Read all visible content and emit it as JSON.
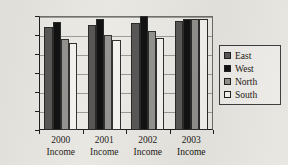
{
  "chart_data": {
    "type": "bar",
    "title": "",
    "subtitle": "",
    "xlabel": "",
    "ylabel": "",
    "categories": [
      "2000 Income",
      "2001 Income",
      "2002 Income",
      "2003 Income"
    ],
    "category_lines": [
      [
        "2000",
        "Income"
      ],
      [
        "2001",
        "Income"
      ],
      [
        "2002",
        "Income"
      ],
      [
        "2003",
        "Income"
      ]
    ],
    "series": [
      {
        "name": "East",
        "color": "#595755",
        "values": [
          27200,
          27700,
          28200,
          28600
        ]
      },
      {
        "name": "West",
        "color": "#121212",
        "values": [
          28500,
          29100,
          30000,
          29100
        ]
      },
      {
        "name": "North",
        "color": "#918f8c",
        "values": [
          24000,
          25000,
          26000,
          29200
        ]
      },
      {
        "name": "South",
        "color": "#f4f2ee",
        "values": [
          22900,
          23800,
          24300,
          29200
        ]
      }
    ],
    "ylim": [
      0,
      30000
    ],
    "ytick_values": [
      0,
      5000,
      10000,
      15000,
      20000,
      25000,
      30000
    ],
    "ytick_labels": [
      "0",
      "5,000",
      "10,000",
      "15,000",
      "20,000",
      "25,000",
      "30,000"
    ],
    "grid": true,
    "grid_axis": "y",
    "legend_position": "right",
    "legend_entries": [
      "East",
      "West",
      "North",
      "South"
    ],
    "background_color": "#e8e6e1",
    "axis_color": "#1a1a1a",
    "grid_color": "#9a9894"
  }
}
